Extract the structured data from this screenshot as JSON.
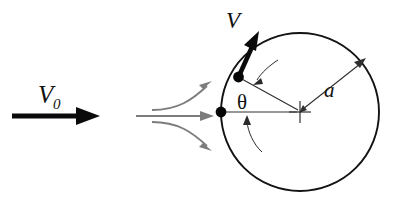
{
  "figure": {
    "kind": "physics-diagram",
    "background_color": "#ffffff",
    "width": 411,
    "height": 211
  },
  "labels": {
    "freestream_symbol": "V",
    "freestream_subscript": "0",
    "surface_velocity": "V",
    "radius": "a",
    "angle": "θ"
  },
  "colors": {
    "ink": "#0a0a0a",
    "circle_stroke": "#131313",
    "streamline_gray": "#7c7c7c",
    "construction_gray": "#303030",
    "background": "#ffffff"
  },
  "geometry": {
    "circle": {
      "center_x": 300,
      "center_y": 112,
      "radius": 79
    },
    "center_cross": {
      "x": 300,
      "y": 112,
      "arm": 11
    },
    "front_stagnation_dot": {
      "x": 221,
      "y": 112,
      "r": 5.2
    },
    "surface_point_dot": {
      "x": 238.5,
      "y": 77,
      "r": 5.2
    },
    "freestream_arrow": {
      "x1": 12,
      "y1": 116,
      "x2": 96,
      "y2": 116,
      "head_length": 22,
      "head_half_width": 9
    },
    "velocity_arrow": {
      "x1": 238.5,
      "y1": 77,
      "x2": 258,
      "y2": 33,
      "head_length": 21,
      "head_half_width": 8
    },
    "radius_line_horizontal": {
      "x1": 221,
      "y1": 112,
      "x2": 300,
      "y2": 112
    },
    "radius_line_slanted": {
      "x1": 238.5,
      "y1": 77,
      "x2": 300,
      "y2": 112
    },
    "radius_dim_arrow": {
      "x1": 300,
      "y1": 112,
      "x2": 364,
      "y2": 60
    },
    "streamlines": [
      {
        "name": "upper-streamline",
        "path": "M 152 110 C 178 110, 192 100, 207 86",
        "tip_x": 210,
        "tip_y": 83,
        "angle_deg": -42
      },
      {
        "name": "center-streamline",
        "path": "M 136 116 L 208 116",
        "tip_x": 212,
        "tip_y": 116,
        "angle_deg": 0
      },
      {
        "name": "lower-streamline",
        "path": "M 152 122 C 178 122, 192 132, 207 146",
        "tip_x": 210,
        "tip_y": 149,
        "angle_deg": 42
      }
    ],
    "angle_indicator": {
      "upper_arc": "M 276 62 C 268 66, 260 73, 256 80",
      "upper_tip_x": 254,
      "upper_tip_y": 83,
      "upper_angle_deg": 125,
      "lower_arc": "M 260 150 C 252 143, 248 130, 247 121",
      "lower_tip_x": 247,
      "lower_tip_y": 116,
      "lower_angle_deg": -85
    },
    "label_positions": {
      "v0": {
        "x": 38,
        "y": 103
      },
      "v0_sub": {
        "x": 53,
        "y": 108
      },
      "v": {
        "x": 227,
        "y": 27
      },
      "a": {
        "x": 325,
        "y": 96
      },
      "theta": {
        "x": 238,
        "y": 108
      }
    }
  }
}
